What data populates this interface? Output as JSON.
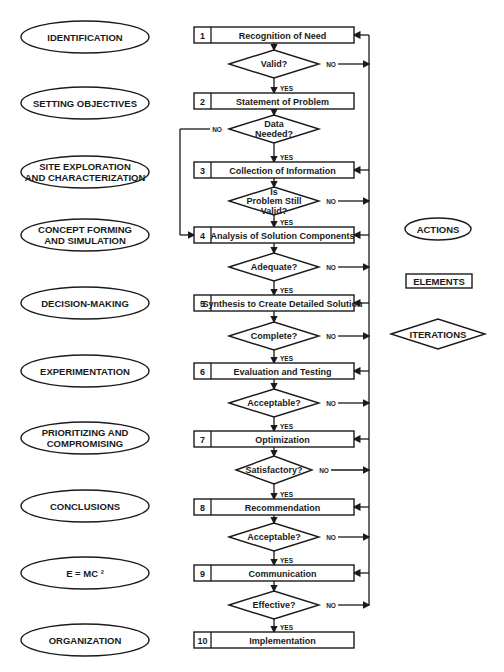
{
  "colors": {
    "ink": "#1a1a1a",
    "background": "#ffffff"
  },
  "actions": [
    {
      "lines": [
        "IDENTIFICATION"
      ]
    },
    {
      "lines": [
        "SETTING OBJECTIVES"
      ]
    },
    {
      "lines": [
        "SITE EXPLORATION",
        "AND CHARACTERIZATION"
      ]
    },
    {
      "lines": [
        "CONCEPT FORMING",
        "AND SIMULATION"
      ]
    },
    {
      "lines": [
        "DECISION-MAKING"
      ]
    },
    {
      "lines": [
        "EXPERIMENTATION"
      ]
    },
    {
      "lines": [
        "PRIORITIZING AND",
        "COMPROMISING"
      ]
    },
    {
      "lines": [
        "CONCLUSIONS"
      ]
    },
    {
      "lines": [
        "E = MC ²"
      ]
    },
    {
      "lines": [
        "ORGANIZATION"
      ]
    }
  ],
  "elements": [
    {
      "num": "1",
      "label": "Recognition of Need"
    },
    {
      "num": "2",
      "label": "Statement of Problem"
    },
    {
      "num": "3",
      "label": "Collection of Information"
    },
    {
      "num": "4",
      "label": "Analysis of Solution Components"
    },
    {
      "num": "5",
      "label": "Synthesis to Create Detailed Solution"
    },
    {
      "num": "6",
      "label": "Evaluation and Testing"
    },
    {
      "num": "7",
      "label": "Optimization"
    },
    {
      "num": "8",
      "label": "Recommendation"
    },
    {
      "num": "9",
      "label": "Communication"
    },
    {
      "num": "10",
      "label": "Implementation"
    }
  ],
  "decisions": [
    {
      "lines": [
        "Valid?"
      ],
      "no": "NO",
      "yes": "YES",
      "no_target": "feedback-right"
    },
    {
      "lines": [
        "Data",
        "Needed?"
      ],
      "no": "NO",
      "yes": "YES",
      "no_target": "loop-left-to-4"
    },
    {
      "lines": [
        "Is",
        "Problem Still",
        "Valid?"
      ],
      "no": "NO",
      "yes": "YES",
      "no_target": "feedback-right"
    },
    {
      "lines": [
        "Adequate?"
      ],
      "no": "NO",
      "yes": "YES",
      "no_target": "feedback-right"
    },
    {
      "lines": [
        "Complete?"
      ],
      "no": "NO",
      "yes": "YES",
      "no_target": "feedback-right"
    },
    {
      "lines": [
        "Acceptable?"
      ],
      "no": "NO",
      "yes": "YES",
      "no_target": "feedback-right"
    },
    {
      "lines": [
        "Satisfactory?"
      ],
      "no": "NO",
      "yes": "YES",
      "no_target": "feedback-right"
    },
    {
      "lines": [
        "Acceptable?"
      ],
      "no": "NO",
      "yes": "YES",
      "no_target": "feedback-right"
    },
    {
      "lines": [
        "Effective?"
      ],
      "no": "NO",
      "yes": "YES",
      "no_target": "feedback-right"
    }
  ],
  "legend": {
    "actions": "ACTIONS",
    "elements": "ELEMENTS",
    "iterations": "ITERATIONS"
  }
}
